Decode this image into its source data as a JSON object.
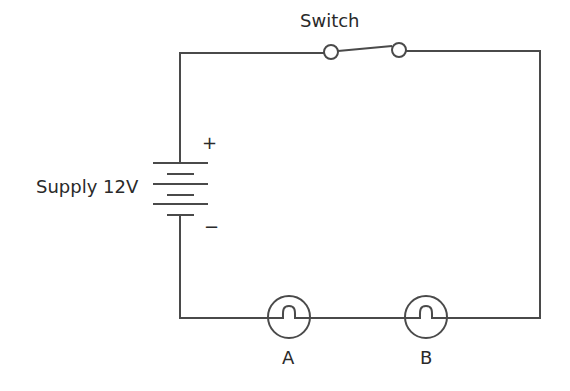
{
  "diagram": {
    "type": "circuit",
    "labels": {
      "switch": "Switch",
      "supply": "Supply 12V",
      "positive": "+",
      "negative": "−",
      "bulb_a": "A",
      "bulb_b": "B"
    },
    "components": [
      {
        "id": "supply",
        "kind": "battery",
        "voltage": "12V"
      },
      {
        "id": "switch",
        "kind": "switch",
        "state": "open"
      },
      {
        "id": "A",
        "kind": "lamp"
      },
      {
        "id": "B",
        "kind": "lamp"
      }
    ],
    "colors": {
      "line": "#4a4a4a",
      "text": "#2a2a2a",
      "background": "#ffffff"
    }
  }
}
